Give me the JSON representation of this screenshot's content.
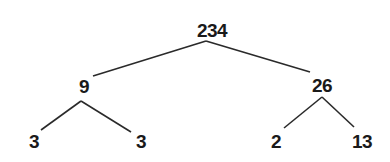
{
  "diagram": {
    "type": "factor-tree",
    "colors": {
      "background": "#ffffff",
      "text": "#1a1a1a",
      "line": "#2a2a2a"
    },
    "nodes": {
      "root": {
        "label": "234",
        "x": 212,
        "y": 30
      },
      "left": {
        "label": "9",
        "x": 84,
        "y": 86
      },
      "right": {
        "label": "26",
        "x": 322,
        "y": 85
      },
      "left_left": {
        "label": "3",
        "x": 34,
        "y": 141
      },
      "left_right": {
        "label": "3",
        "x": 141,
        "y": 141
      },
      "right_left": {
        "label": "2",
        "x": 276,
        "y": 141
      },
      "right_right": {
        "label": "13",
        "x": 362,
        "y": 141
      }
    },
    "edges": [
      {
        "from": "root",
        "to": "left",
        "x1": 206,
        "y1": 41,
        "x2": 93,
        "y2": 76
      },
      {
        "from": "root",
        "to": "right",
        "x1": 206,
        "y1": 41,
        "x2": 310,
        "y2": 72
      },
      {
        "from": "left",
        "to": "left_left",
        "x1": 81,
        "y1": 101,
        "x2": 41,
        "y2": 130
      },
      {
        "from": "left",
        "to": "left_right",
        "x1": 81,
        "y1": 101,
        "x2": 131,
        "y2": 132
      },
      {
        "from": "right",
        "to": "right_left",
        "x1": 322,
        "y1": 97,
        "x2": 284,
        "y2": 128
      },
      {
        "from": "right",
        "to": "right_right",
        "x1": 322,
        "y1": 97,
        "x2": 354,
        "y2": 127
      }
    ]
  }
}
